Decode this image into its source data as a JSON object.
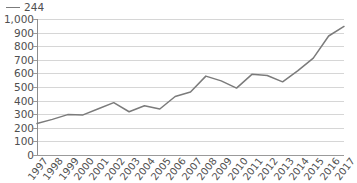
{
  "legend": {
    "entries": [
      {
        "label": "244",
        "color": "#7b7b7b",
        "marker": "line-marker"
      }
    ],
    "position": "top-left"
  },
  "title_remnant": "",
  "axis": {
    "y_ticks": [
      "1,000",
      "900",
      "800",
      "700",
      "600",
      "500",
      "400",
      "300",
      "200",
      "100",
      "0"
    ],
    "x_ticks": [
      "1997",
      "1998",
      "1999",
      "2000",
      "2001",
      "2002",
      "2003",
      "2004",
      "2005",
      "2006",
      "2007",
      "2008",
      "2009",
      "2010",
      "2011",
      "2012",
      "2013",
      "2014",
      "2015",
      "2016",
      "2017"
    ]
  },
  "colors": {
    "series_line": "#7b7b7b",
    "gridline": "#d6d6d6",
    "axis_line": "#8e8e8e",
    "text": "#4f4f4f",
    "background": "#ffffff"
  },
  "chart_data": {
    "type": "line",
    "title": "",
    "subtitle": "",
    "xlabel": "",
    "ylabel": "",
    "x": [
      "1997",
      "1998",
      "1999",
      "2000",
      "2001",
      "2002",
      "2003",
      "2004",
      "2005",
      "2006",
      "2007",
      "2008",
      "2009",
      "2010",
      "2011",
      "2012",
      "2013",
      "2014",
      "2015",
      "2016",
      "2017"
    ],
    "categories": [
      "1997",
      "1998",
      "1999",
      "2000",
      "2001",
      "2002",
      "2003",
      "2004",
      "2005",
      "2006",
      "2007",
      "2008",
      "2009",
      "2010",
      "2011",
      "2012",
      "2013",
      "2014",
      "2015",
      "2016",
      "2017"
    ],
    "series": [
      {
        "name": "244",
        "color": "#7b7b7b",
        "values": [
          232,
          262,
          297,
          295,
          340,
          385,
          318,
          362,
          338,
          430,
          463,
          580,
          545,
          492,
          593,
          585,
          538,
          620,
          712,
          875,
          945
        ]
      }
    ],
    "ylim": [
      0,
      1000
    ],
    "ytick_interval": 100,
    "grid": true,
    "grid_axis": "y",
    "legend_position": "top-left",
    "markers": false
  }
}
